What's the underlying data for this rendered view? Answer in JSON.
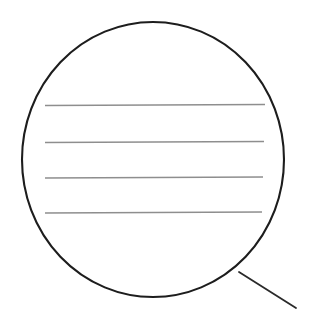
{
  "figure": {
    "name": "speech-bubble-with-blank-lines",
    "width": 309,
    "height": 316,
    "background_color": "#ffffff"
  },
  "bubble": {
    "shape": "ellipse",
    "center_x": 153,
    "center_y": 159.5,
    "radius_x": 131,
    "radius_y": 137.5,
    "stroke_color": "#1d1d1d",
    "stroke_width": 2.1,
    "fill_color": "#ffffff"
  },
  "tail": {
    "shape": "line",
    "x1": 239,
    "y1": 272,
    "x2": 296,
    "y2": 308,
    "stroke_color": "#2a2a2a",
    "stroke_width": 1.8
  },
  "rules": {
    "stroke_color": "#8e8e8e",
    "stroke_width": 1.4,
    "count": 4,
    "lines": [
      {
        "label": "rule-1",
        "x1": 45,
        "y1": 105.5,
        "x2": 265,
        "y2": 104.5
      },
      {
        "label": "rule-2",
        "x1": 45,
        "y1": 142.5,
        "x2": 264,
        "y2": 141.5
      },
      {
        "label": "rule-3",
        "x1": 45,
        "y1": 178.0,
        "x2": 263,
        "y2": 177.0
      },
      {
        "label": "rule-4",
        "x1": 45,
        "y1": 213.0,
        "x2": 262,
        "y2": 212.0
      }
    ]
  },
  "labels": {
    "caption": "",
    "annotations": []
  }
}
